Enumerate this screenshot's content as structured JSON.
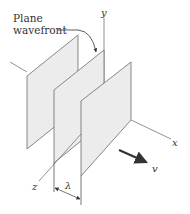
{
  "diagram": {
    "callout": {
      "line1": "Plane",
      "line2": "wavefront"
    },
    "axes": {
      "x": "x",
      "y": "y",
      "z": "z"
    },
    "velocity_label": "v",
    "wavelength_label": "λ",
    "planes_count": 3,
    "colors": {
      "plane_fill": "#ececec",
      "plane_edge": "#6a6a6a",
      "text": "#333333",
      "arrow": "#333333"
    }
  }
}
